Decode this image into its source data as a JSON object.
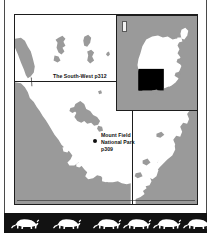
{
  "page": {
    "background_color": "#ffffff",
    "width": 212,
    "height": 241
  },
  "colors": {
    "sea": "#9a9a9a",
    "land": "#ffffff",
    "ink": "#1d1d1d",
    "highlight": "#000000",
    "band_background": "#121212",
    "band_figure": "#ffffff"
  },
  "map": {
    "labels": {
      "southwest": "The South-West p312",
      "mount_field_line1": "Mount Field",
      "mount_field_line2": "National Park",
      "mount_field_line3": "p309"
    },
    "markers": {
      "park_dot_name": "national-park-point-marker"
    }
  },
  "inset": {
    "region_name": "Tasmania",
    "highlight_region": "South-West",
    "corner_marker": "north-indicator"
  },
  "decor": {
    "motif": "thylacine-silhouette",
    "count": 5
  }
}
